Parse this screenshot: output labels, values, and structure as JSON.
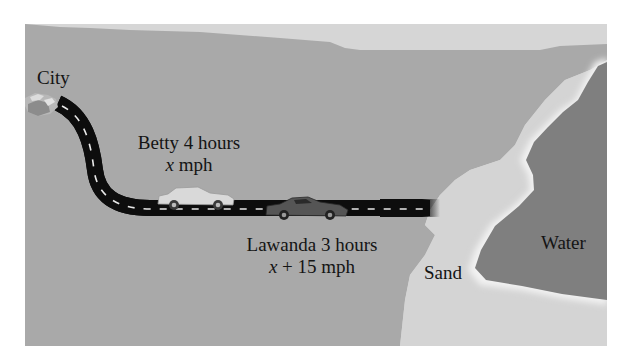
{
  "diagram": {
    "colors": {
      "background": "#ffffff",
      "land": "#a9a9a9",
      "sky_band": "#d6d6d6",
      "sand": "#d4d4d4",
      "water": "#7f7f7f",
      "shore_highlight": "#f2f2f2",
      "road": "#0d0d0d",
      "road_dash": "#e8e8e8",
      "car_light": "#d9d9d9",
      "car_dark": "#555555",
      "city": "#b8b8b8"
    },
    "labels": {
      "city": "City",
      "betty_line1": "Betty 4 hours",
      "betty_var": "x",
      "betty_unit": " mph",
      "lawanda_line1": "Lawanda 3 hours",
      "lawanda_var": "x",
      "lawanda_expr": " + 15 mph",
      "sand": "Sand",
      "water": "Water"
    },
    "icons": {
      "city": "city-buildings-icon",
      "car_betty": "light-car-icon",
      "car_lawanda": "dark-sports-car-icon"
    }
  }
}
